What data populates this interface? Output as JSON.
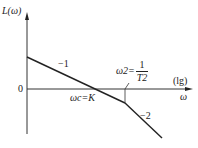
{
  "diagram": {
    "type": "bode-magnitude-asymptote",
    "y_axis_label": "L(ω)",
    "x_axis_label": "ω",
    "x_scale_label": "(lg)",
    "origin_label": "0",
    "crossover_label": "ωc=K",
    "break_label_prefix": "ω2=",
    "break_fraction_num": "1",
    "break_fraction_den": "T2",
    "slope_1_label": "−1",
    "slope_2_label": "−2",
    "colors": {
      "line": "#222222",
      "axis": "#333333"
    }
  }
}
